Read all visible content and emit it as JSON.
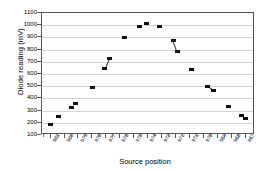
{
  "chart_data": {
    "type": "scatter",
    "title": "",
    "xlabel": "Source position",
    "ylabel": "Diode reading (mV)",
    "ylim": [
      100,
      1100
    ],
    "ytick_labels": [
      "1100",
      "1000",
      "900",
      "800",
      "700",
      "600",
      "500",
      "400",
      "300",
      "200",
      "100"
    ],
    "ytick_values": [
      1100,
      1000,
      900,
      800,
      700,
      600,
      500,
      400,
      300,
      200,
      100
    ],
    "grid": "horizontal",
    "legend": "none",
    "categories": [
      "981",
      "980",
      "979",
      "978",
      "977",
      "976",
      "975",
      "974",
      "973",
      "972",
      "971",
      "970",
      "969",
      "968",
      "967"
    ],
    "xtick_labels": [
      "981",
      "980",
      "979",
      "978",
      "977",
      "976",
      "975",
      "974",
      "973",
      "972",
      "971",
      "970",
      "969",
      "968",
      "967"
    ],
    "marker_style": "filled-square",
    "marker_color": "#111111",
    "points": [
      {
        "x": 981.0,
        "y": 185
      },
      {
        "x": 980.4,
        "y": 255
      },
      {
        "x": 979.5,
        "y": 327
      },
      {
        "x": 979.2,
        "y": 358
      },
      {
        "x": 978.0,
        "y": 490
      },
      {
        "x": 977.1,
        "y": 641
      },
      {
        "x": 976.8,
        "y": 723
      },
      {
        "x": 975.7,
        "y": 903
      },
      {
        "x": 974.6,
        "y": 990
      },
      {
        "x": 974.1,
        "y": 1016
      },
      {
        "x": 973.2,
        "y": 988
      },
      {
        "x": 972.2,
        "y": 872
      },
      {
        "x": 971.9,
        "y": 782
      },
      {
        "x": 970.9,
        "y": 637
      },
      {
        "x": 969.7,
        "y": 500
      },
      {
        "x": 969.3,
        "y": 465
      },
      {
        "x": 968.2,
        "y": 332
      },
      {
        "x": 967.3,
        "y": 257
      },
      {
        "x": 967.0,
        "y": 233
      }
    ],
    "connected_pairs": [
      [
        5,
        6
      ],
      [
        11,
        12
      ],
      [
        14,
        15
      ]
    ]
  },
  "axes": {
    "y_axis_title": "Diode reading (mV)",
    "x_axis_title": "Source position"
  }
}
